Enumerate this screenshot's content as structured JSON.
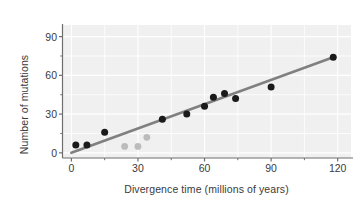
{
  "chart_data": {
    "type": "scatter",
    "title": "",
    "xlabel": "Divergence time (millions of years)",
    "ylabel": "Number of mutations",
    "xlim": [
      -4,
      126
    ],
    "ylim": [
      -4,
      99
    ],
    "xticks": [
      0,
      30,
      60,
      90,
      120
    ],
    "yticks": [
      0,
      30,
      60,
      90
    ],
    "xminorticks": [
      15,
      45,
      75,
      105
    ],
    "yminorticks": [
      15,
      45,
      75
    ],
    "grid": true,
    "legend": "none",
    "series": [
      {
        "name": "Primate comparisons",
        "marker": "circle",
        "color": "#1a1a1a",
        "points": [
          {
            "x": 2,
            "y": 6
          },
          {
            "x": 7,
            "y": 6
          },
          {
            "x": 15,
            "y": 16
          },
          {
            "x": 41,
            "y": 26
          },
          {
            "x": 52,
            "y": 30
          },
          {
            "x": 60,
            "y": 36
          },
          {
            "x": 64,
            "y": 43
          },
          {
            "x": 69,
            "y": 46
          },
          {
            "x": 74,
            "y": 42
          },
          {
            "x": 90,
            "y": 51
          },
          {
            "x": 118,
            "y": 74
          }
        ]
      },
      {
        "name": "Outlier comparisons",
        "marker": "circle",
        "color": "#bcbcbc",
        "points": [
          {
            "x": 24,
            "y": 5
          },
          {
            "x": 30,
            "y": 5
          },
          {
            "x": 34,
            "y": 12
          }
        ]
      }
    ],
    "trendline": {
      "name": "Molecular clock regression",
      "color": "#808080",
      "from": {
        "x": 0,
        "y": 0
      },
      "to": {
        "x": 118,
        "y": 74
      },
      "slope": 0.627,
      "intercept": 0
    },
    "ytick_labels": [
      "0",
      "30",
      "60",
      "90"
    ],
    "xtick_labels": [
      "0",
      "30",
      "60",
      "90",
      "120"
    ]
  },
  "axis_titles": {
    "x": "Divergence time (millions of years)",
    "y": "Number of mutations"
  },
  "colors": {
    "plot_background": "#f0f0f0",
    "gridline": "#e4e4e4",
    "axis": "#6e6e6e",
    "point_primary": "#1a1a1a",
    "point_secondary": "#bcbcbc",
    "trendline": "#808080",
    "text": "#3a3a3a"
  }
}
